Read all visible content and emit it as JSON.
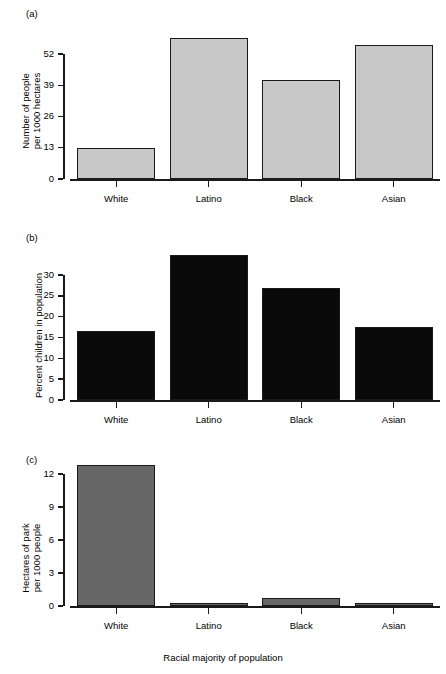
{
  "figure": {
    "xaxis_title": "Racial majority of population",
    "categories": [
      "White",
      "Latino",
      "Black",
      "Asian"
    ]
  },
  "panels": [
    {
      "label": "(a)",
      "ylabel_line1": "Number of people",
      "ylabel_line2": "per 1000 hectares",
      "bar_color": "#c8c8c8",
      "ticks": [
        "0",
        "13",
        "26",
        "39",
        "52"
      ]
    },
    {
      "label": "(b)",
      "ylabel_line1": "Percent children in population",
      "ylabel_line2": "",
      "bar_color": "#0a0a0a",
      "ticks": [
        "0",
        "5",
        "10",
        "15",
        "20",
        "25",
        "30"
      ]
    },
    {
      "label": "(c)",
      "ylabel_line1": "Hectares of park",
      "ylabel_line2": "per 1000 people",
      "bar_color": "#666666",
      "ticks": [
        "0",
        "3",
        "6",
        "9",
        "12"
      ]
    }
  ],
  "chart_data": [
    {
      "type": "bar",
      "panel": "(a)",
      "title": "",
      "categories": [
        "White",
        "Latino",
        "Black",
        "Asian"
      ],
      "values": [
        13.0,
        58.8,
        41.0,
        55.8
      ],
      "xlabel": "",
      "ylabel": "Number of people per 1000 hectares",
      "ytick_values": [
        0,
        13,
        26,
        39,
        52
      ],
      "ylim": [
        0,
        60
      ],
      "grid": false,
      "legend": "none",
      "bar_color": "#c8c8c8"
    },
    {
      "type": "bar",
      "panel": "(b)",
      "title": "",
      "categories": [
        "White",
        "Latino",
        "Black",
        "Asian"
      ],
      "values": [
        16.5,
        34.8,
        27.0,
        17.5
      ],
      "xlabel": "",
      "ylabel": "Percent children in population",
      "ytick_values": [
        0,
        5,
        10,
        15,
        20,
        25,
        30
      ],
      "ylim": [
        0,
        35
      ],
      "grid": false,
      "legend": "none",
      "bar_color": "#0a0a0a"
    },
    {
      "type": "bar",
      "panel": "(c)",
      "title": "",
      "categories": [
        "White",
        "Latino",
        "Black",
        "Asian"
      ],
      "values": [
        12.8,
        0.25,
        0.7,
        0.05
      ],
      "xlabel": "Racial majority of population",
      "ylabel": "Hectares of park per 1000 people",
      "ytick_values": [
        0,
        3,
        6,
        9,
        12
      ],
      "ylim": [
        0,
        13
      ],
      "grid": false,
      "legend": "none",
      "bar_color": "#666666"
    }
  ]
}
